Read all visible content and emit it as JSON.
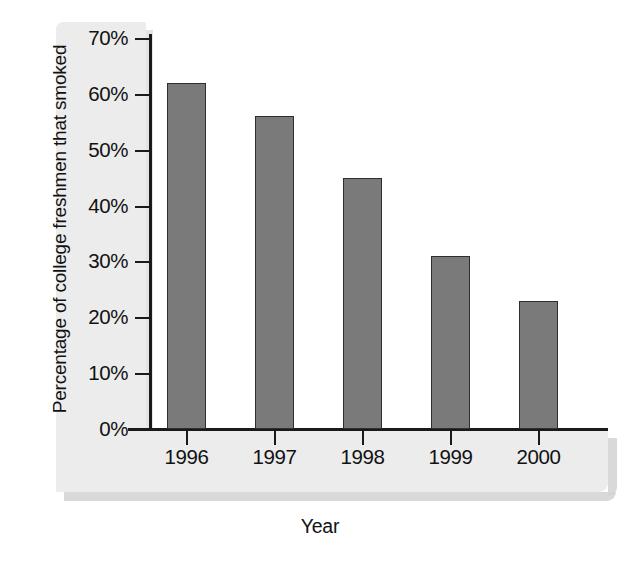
{
  "chart_data": {
    "type": "bar",
    "title": "",
    "xlabel": "Year",
    "ylabel": "Percentage of college freshmen that smoked",
    "categories": [
      "1996",
      "1997",
      "1998",
      "1999",
      "2000"
    ],
    "values": [
      62,
      56,
      45,
      31,
      23
    ],
    "ylim": [
      0,
      70
    ],
    "ytick_values": [
      0,
      10,
      20,
      30,
      40,
      50,
      60,
      70
    ],
    "ytick_labels": [
      "0%",
      "10%",
      "20%",
      "30%",
      "40%",
      "50%",
      "60%",
      "70%"
    ],
    "grid": false,
    "legend": false,
    "legend_position": "none",
    "series": [
      {
        "name": "Percentage of college freshmen that smoked",
        "values": [
          62,
          56,
          45,
          31,
          23
        ]
      }
    ],
    "colors": {
      "bar_fill": "#7a7a7a",
      "bar_outline": "#2e2e2e",
      "axis": "#1a1a1a",
      "plot_background": "#ffffff",
      "panel_background": "#ececec",
      "shadow": "#d2d2d2",
      "text": "#121212"
    }
  }
}
